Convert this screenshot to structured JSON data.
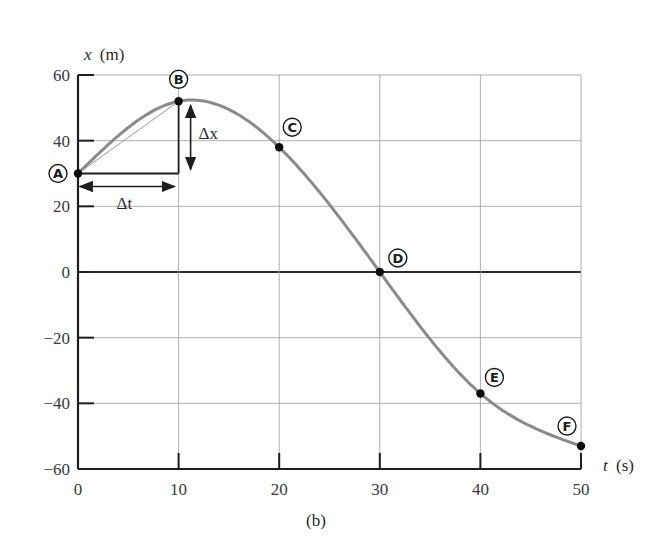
{
  "chart_data": {
    "type": "line",
    "title": "",
    "caption": "(b)",
    "xlabel": "t (s)",
    "ylabel": "x (m)",
    "xlabel_var": "t",
    "xlabel_unit": "(s)",
    "ylabel_var": "x",
    "ylabel_unit": "(m)",
    "xlim": [
      0,
      50
    ],
    "ylim": [
      -60,
      60
    ],
    "xticks": [
      0,
      10,
      20,
      30,
      40,
      50
    ],
    "yticks": [
      -60,
      -40,
      -20,
      0,
      20,
      40,
      60
    ],
    "xtick_labels": [
      "0",
      "10",
      "20",
      "30",
      "40",
      "50"
    ],
    "ytick_labels": [
      "−60",
      "−40",
      "−20",
      "0",
      "20",
      "40",
      "60"
    ],
    "grid": true,
    "series": [
      {
        "name": "position vs time",
        "color": "#8a8a8a",
        "points": [
          {
            "label": "A",
            "t": 0,
            "x": 30
          },
          {
            "label": "B",
            "t": 10,
            "x": 52
          },
          {
            "label": "C",
            "t": 20,
            "x": 38
          },
          {
            "label": "D",
            "t": 30,
            "x": 0
          },
          {
            "label": "E",
            "t": 40,
            "x": -37
          },
          {
            "label": "F",
            "t": 50,
            "x": -53
          }
        ]
      }
    ],
    "annotations": {
      "delta_t_label": "Δt",
      "delta_x_label": "Δx",
      "secant_from": "A",
      "secant_to": "B"
    }
  }
}
